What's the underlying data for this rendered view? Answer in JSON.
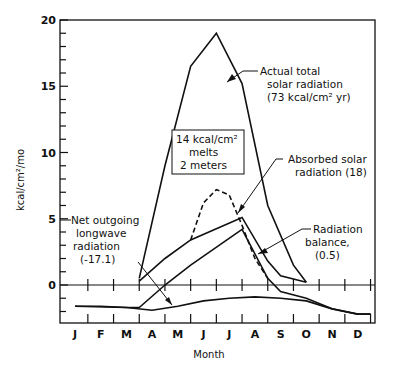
{
  "chart_data": {
    "type": "line",
    "title": "",
    "xlabel": "Month",
    "ylabel": "kcal/cm2/mo",
    "ylim": [
      -3,
      20
    ],
    "yticks": [
      0,
      5,
      10,
      15,
      20
    ],
    "categories": [
      "J",
      "F",
      "M",
      "A",
      "M",
      "J",
      "J",
      "A",
      "S",
      "O",
      "N",
      "D"
    ],
    "grid": false,
    "series": [
      {
        "name": "Actual total solar radiation",
        "annotation": "Actual total solar radiation (73 kcal/cm² yr)",
        "style": "solid",
        "x": [
          2.5,
          3.5,
          4.5,
          5.5,
          6.5,
          7.5,
          8.5,
          9.0
        ],
        "values": [
          0.5,
          9.0,
          16.5,
          19.0,
          15.2,
          6.0,
          1.5,
          0.2
        ]
      },
      {
        "name": "Absorbed solar radiation",
        "annotation": "Absorbed solar radiation (18)",
        "style": "solid",
        "x": [
          2.5,
          3.5,
          4.5,
          6.5,
          7.5,
          8.0,
          9.0
        ],
        "values": [
          0.3,
          2.0,
          3.4,
          5.1,
          1.8,
          0.7,
          0.2
        ]
      },
      {
        "name": "Snowmelt absorbed (dashed)",
        "style": "dashed",
        "x": [
          4.5,
          5.0,
          5.5,
          6.0,
          6.5,
          7.0,
          7.5
        ],
        "values": [
          3.4,
          6.2,
          7.2,
          6.8,
          4.5,
          2.0,
          0.5
        ]
      },
      {
        "name": "Radiation balance",
        "annotation": "Radiation balance, (0.5)",
        "style": "solid",
        "x": [
          0,
          2.0,
          2.5,
          3.5,
          4.5,
          6.5,
          7.5,
          8.0,
          9.0,
          10.0,
          11.0,
          11.5
        ],
        "values": [
          -1.6,
          -1.7,
          -1.7,
          0.0,
          1.5,
          4.2,
          0.5,
          -0.5,
          -1.0,
          -1.8,
          -2.2,
          -2.2
        ]
      },
      {
        "name": "Net outgoing longwave radiation",
        "annotation": "Net outgoing longwave radiation (-17.1)",
        "style": "solid",
        "x": [
          0,
          1.0,
          2.0,
          3.0,
          4.0,
          5.0,
          6.0,
          7.0,
          8.0,
          9.0,
          10.0,
          11.0,
          11.5
        ],
        "values": [
          -1.6,
          -1.6,
          -1.7,
          -1.9,
          -1.6,
          -1.2,
          -1.0,
          -0.9,
          -1.0,
          -1.2,
          -1.8,
          -2.2,
          -2.2
        ]
      }
    ],
    "annotations": [
      {
        "text": "14 kcal/cm² melts 2 meters",
        "boxed": true
      }
    ]
  },
  "labels": {
    "xlabel": "Month",
    "ylabel": "kcal/cm²/mo",
    "yticks": [
      "0",
      "5",
      "10",
      "15",
      "20"
    ],
    "months": [
      "J",
      "F",
      "M",
      "A",
      "M",
      "J",
      "J",
      "A",
      "S",
      "O",
      "N",
      "D"
    ],
    "actual": [
      "Actual total",
      "solar radiation",
      "(73 kcal/cm² yr)"
    ],
    "absorbed": [
      "Absorbed solar",
      "radiation (18)"
    ],
    "netlw": [
      "Net outgoing",
      "longwave",
      "radiation",
      "(-17.1)"
    ],
    "balance": [
      "Radiation",
      "balance,",
      "(0.5)"
    ],
    "box": [
      "14 kcal/cm²",
      "melts",
      "2 meters"
    ]
  }
}
